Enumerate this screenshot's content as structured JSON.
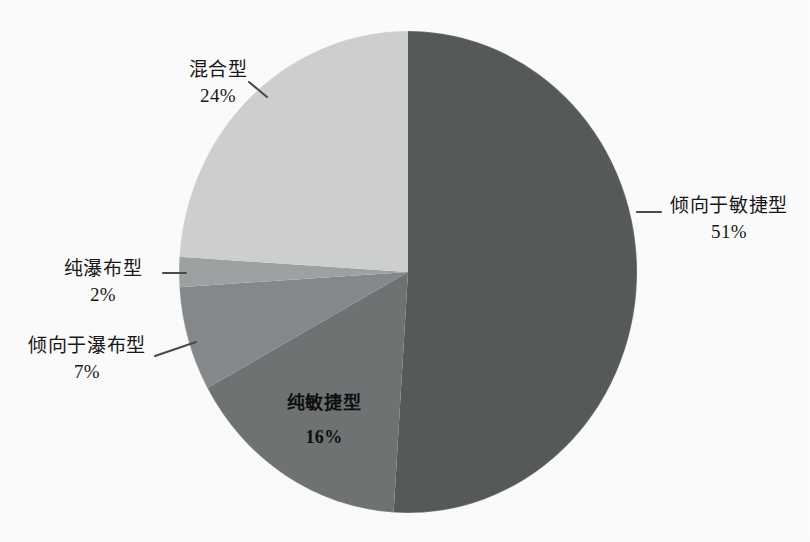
{
  "chart_data": {
    "type": "pie",
    "title": "",
    "subtitle": "",
    "xlabel": "",
    "ylabel": "",
    "legend_position": "none",
    "grid": false,
    "start_angle_deg": 0,
    "direction": "clockwise",
    "categories": [
      "倾向于敏捷型",
      "纯敏捷型",
      "倾向于瀑布型",
      "纯瀑布型",
      "混合型"
    ],
    "values": [
      51,
      16,
      7,
      2,
      24
    ],
    "value_unit": "%",
    "labels": [
      "51%",
      "16%",
      "7%",
      "2%",
      "24%"
    ],
    "colors": [
      "#56595a",
      "#6f7273",
      "#85888a",
      "#9ea1a2",
      "#cdcfce"
    ],
    "slices": [
      {
        "name": "倾向于敏捷型",
        "value": 51,
        "label": "51%",
        "color": "#56595a",
        "label_placement": "outside-right"
      },
      {
        "name": "纯敏捷型",
        "value": 16,
        "label": "16%",
        "color": "#6f7273",
        "label_placement": "inside"
      },
      {
        "name": "倾向于瀑布型",
        "value": 7,
        "label": "7%",
        "color": "#85888a",
        "label_placement": "outside-left"
      },
      {
        "name": "纯瀑布型",
        "value": 2,
        "label": "2%",
        "color": "#9ea1a2",
        "label_placement": "outside-left"
      },
      {
        "name": "混合型",
        "value": 24,
        "label": "24%",
        "color": "#cdcfce",
        "label_placement": "outside-left"
      }
    ]
  },
  "callouts": {
    "mixed": {
      "category": "混合型",
      "value": "24%"
    },
    "pure_waterfall": {
      "category": "纯瀑布型",
      "value": "2%"
    },
    "toward_waterfall": {
      "category": "倾向于瀑布型",
      "value": "7%"
    },
    "toward_agile": {
      "category": "倾向于敏捷型",
      "value": "51%"
    },
    "pure_agile": {
      "category": "纯敏捷型",
      "value": "16%"
    }
  }
}
